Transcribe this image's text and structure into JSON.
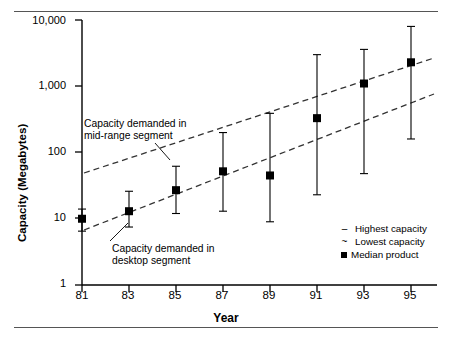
{
  "chart_data": {
    "type": "scatter",
    "title": "",
    "xlabel": "Year",
    "ylabel": "Capacity (Megabytes)",
    "yscale": "log",
    "ylim": [
      1,
      10000
    ],
    "xlim": [
      81,
      95
    ],
    "grid": false,
    "x_tick_labels": [
      "81",
      "83",
      "85",
      "87",
      "89",
      "91",
      "93",
      "95"
    ],
    "x_tick_values": [
      81,
      83,
      85,
      87,
      89,
      91,
      93,
      95
    ],
    "y_tick_labels": [
      "10,000",
      "1,000",
      "100",
      "10",
      "1"
    ],
    "y_tick_values": [
      10000,
      1000,
      100,
      10,
      1
    ],
    "legend_position": "bottom-right",
    "legend": [
      {
        "marker": "-",
        "label": "Highest capacity"
      },
      {
        "marker": "~",
        "label": "Lowest capacity"
      },
      {
        "marker": "square",
        "label": "Median product"
      }
    ],
    "series": [
      {
        "name": "Median product",
        "marker": "filled-square",
        "x": [
          81,
          83,
          85,
          87,
          89,
          91,
          93,
          95
        ],
        "values": [
          10,
          13,
          27,
          52,
          45,
          330,
          1100,
          2300
        ],
        "errors_high": [
          14,
          26,
          62,
          200,
          390,
          3000,
          3600,
          8000
        ],
        "errors_low": [
          6.5,
          7.5,
          12,
          13,
          9,
          23,
          48,
          160
        ]
      }
    ],
    "annotations": [
      {
        "name": "mid-range-demand",
        "text_line1": "Capacity demanded in",
        "text_line2": "mid-range segment",
        "trend_start": {
          "x": 81,
          "y": 22
        },
        "trend_end": {
          "x": 95,
          "y": 2600
        }
      },
      {
        "name": "desktop-demand",
        "text_line1": "Capacity demanded in",
        "text_line2": "desktop segment",
        "trend_start": {
          "x": 81,
          "y": 6.5
        },
        "trend_end": {
          "x": 95,
          "y": 700
        }
      }
    ]
  },
  "axes": {
    "y_label": "Capacity (Megabytes)",
    "x_label": "Year",
    "y_ticks": [
      "10,000",
      "1,000",
      "100",
      "10",
      "1"
    ],
    "x_ticks": [
      "81",
      "83",
      "85",
      "87",
      "89",
      "91",
      "93",
      "95"
    ]
  },
  "annotations": {
    "mid_range": {
      "line1": "Capacity demanded in",
      "line2": "mid-range segment"
    },
    "desktop": {
      "line1": "Capacity demanded in",
      "line2": "desktop segment"
    }
  },
  "legend": {
    "items": [
      {
        "marker": "–",
        "label": "Highest capacity"
      },
      {
        "marker": "~",
        "label": "Lowest capacity"
      },
      {
        "marker": "■",
        "label": "Median product"
      }
    ]
  },
  "colors": {
    "axis": "#000000",
    "marker": "#000000",
    "trend": "#333333",
    "rule": "#555555",
    "background": "#ffffff"
  }
}
